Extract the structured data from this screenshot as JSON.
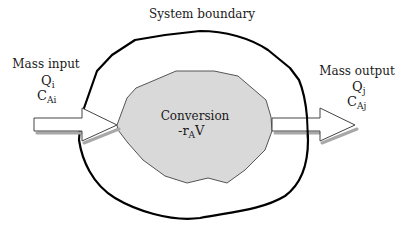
{
  "diagram": {
    "boundary_label": "System boundary",
    "input": {
      "label": "Mass input",
      "flow_symbol": "Q",
      "flow_subscript": "i",
      "conc_symbol": "C",
      "conc_subscript": "Ai"
    },
    "output": {
      "label": "Mass output",
      "flow_symbol": "Q",
      "flow_subscript": "j",
      "conc_symbol": "C",
      "conc_subscript": "Aj"
    },
    "conversion": {
      "label": "Conversion",
      "rate_prefix": "-r",
      "rate_subscript": "A",
      "rate_suffix": "V"
    },
    "colors": {
      "boundary_stroke": "#000000",
      "conversion_fill": "#d9d9d9",
      "conversion_stroke": "#555555",
      "arrow_fill": "#ffffff",
      "arrow_stroke": "#444444",
      "arrow_shadow": "#a8a8a8",
      "text": "#1a1a1a"
    }
  }
}
